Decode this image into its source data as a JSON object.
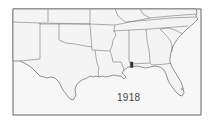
{
  "map": {
    "title": "Southern United States",
    "year_label": "1918",
    "region": "Southeastern and south-central United States",
    "states_shown": [
      "New Mexico",
      "Colorado",
      "Kansas",
      "Oklahoma",
      "Texas",
      "Arkansas",
      "Louisiana",
      "Missouri",
      "Mississippi",
      "Alabama",
      "Tennessee",
      "Kentucky",
      "Georgia",
      "Florida",
      "South Carolina",
      "North Carolina",
      "Virginia"
    ],
    "marker": {
      "location": "Mobile, Alabama area",
      "color": "#333333"
    },
    "colors": {
      "land": "#f4f4f4",
      "border": "#666666",
      "background": "#ffffff"
    }
  }
}
